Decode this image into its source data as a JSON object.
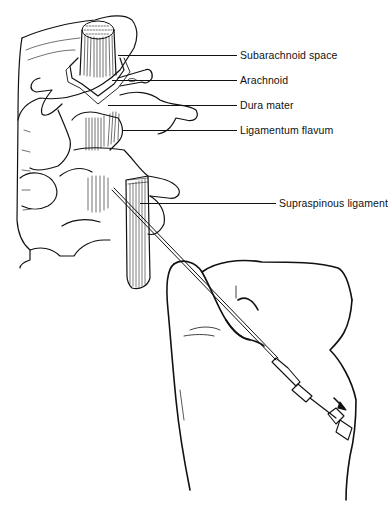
{
  "figure": {
    "labels": [
      {
        "text": "Subarachnoid space",
        "y": 55,
        "line_x1": 118,
        "line_x2": 237
      },
      {
        "text": "Arachnoid",
        "y": 80,
        "line_x1": 112,
        "line_x2": 237
      },
      {
        "text": "Dura mater",
        "y": 105,
        "line_x1": 108,
        "line_x2": 237
      },
      {
        "text": "Ligamentum flavum",
        "y": 130,
        "line_x1": 122,
        "line_x2": 237
      },
      {
        "text": "Supraspinous ligament",
        "y": 203,
        "line_x1": 140,
        "line_x2": 276
      }
    ],
    "colors": {
      "ink": "#111111",
      "paper": "#ffffff"
    }
  }
}
